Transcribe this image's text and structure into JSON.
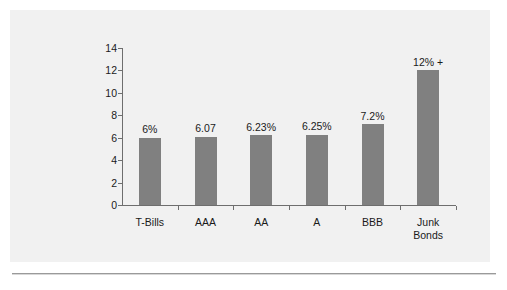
{
  "chart_data": {
    "type": "bar",
    "title": "",
    "xlabel": "",
    "ylabel": "",
    "categories": [
      "T-Bills",
      "AAA",
      "AA",
      "A",
      "BBB",
      "Junk\nBonds"
    ],
    "values": [
      6,
      6.07,
      6.23,
      6.25,
      7.2,
      12
    ],
    "data_labels": [
      "6%",
      "6.07",
      "6.23%",
      "6.25%",
      "7.2%",
      "12% +"
    ],
    "ylim": [
      0,
      14
    ],
    "y_ticks": [
      "0",
      "2",
      "4",
      "6",
      "8",
      "10",
      "12",
      "14"
    ],
    "y_tick_values": [
      0,
      2,
      4,
      6,
      8,
      10,
      12,
      14
    ],
    "grid": false,
    "legend": false,
    "legend_position": "none",
    "bar_color": "#808080",
    "axis_color": "#6e6e6e",
    "panel_background": "#f1f1f1",
    "page_background": "#ffffff",
    "text_color": "#1a1a1a"
  }
}
